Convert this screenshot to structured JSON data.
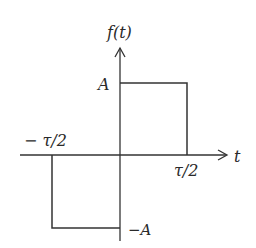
{
  "diagram": {
    "type": "piecewise-function-plot",
    "y_axis_label": "f(t)",
    "x_axis_label": "t",
    "labels": {
      "pos_amplitude": "A",
      "neg_amplitude": "−A",
      "neg_half_width": "− τ/2",
      "pos_half_width": "τ/2"
    },
    "segments": [
      {
        "t_start": "−τ/2",
        "t_end": "0",
        "value": "−A"
      },
      {
        "t_start": "0",
        "t_end": "τ/2",
        "value": "A"
      }
    ],
    "colors": {
      "line": "#333333",
      "background": "#ffffff"
    }
  }
}
